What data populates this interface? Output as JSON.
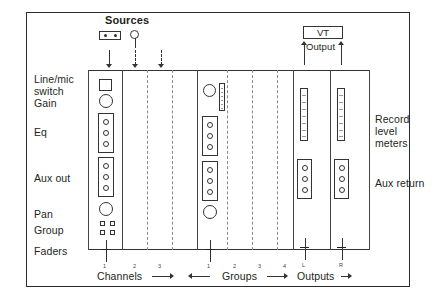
{
  "diagram": {
    "frame": {
      "border_color": "#2a2a2a",
      "background": "#ffffff"
    },
    "sources": {
      "label": "Sources",
      "icons": [
        {
          "name": "tape-machine-icon",
          "kind": "tape"
        },
        {
          "name": "microphone-icon",
          "kind": "mic"
        }
      ]
    },
    "vt": {
      "label": "VT",
      "output_label": "Output"
    },
    "row_labels": [
      {
        "id": "line-mic-switch",
        "line1": "Line/mic",
        "line2": "switch"
      },
      {
        "id": "gain",
        "text": "Gain"
      },
      {
        "id": "eq",
        "text": "Eq"
      },
      {
        "id": "aux-out",
        "text": "Aux out"
      },
      {
        "id": "pan",
        "text": "Pan"
      },
      {
        "id": "group",
        "text": "Group"
      },
      {
        "id": "faders",
        "text": "Faders"
      }
    ],
    "right_labels": [
      {
        "id": "record-level-meters",
        "line1": "Record",
        "line2": "level",
        "line3": "meters"
      },
      {
        "id": "aux-return",
        "text": "Aux return"
      }
    ],
    "sections": [
      {
        "id": "channels",
        "label": "Channels",
        "arrow": "right",
        "strip_numbers": [
          "1",
          "2",
          "3"
        ]
      },
      {
        "id": "groups",
        "label": "Groups",
        "arrow": "right",
        "lead_arrow": "left",
        "strip_numbers": [
          "1",
          "2",
          "3",
          "4"
        ]
      },
      {
        "id": "outputs",
        "label": "Outputs",
        "arrow": "right",
        "strip_numbers": [
          "L",
          "R"
        ]
      }
    ],
    "channel_strip": {
      "controls": [
        "line-mic-switch",
        "gain-knob",
        "eq-block",
        "aux-block",
        "pan-knob",
        "group-buttons",
        "fader"
      ],
      "eq_knob_count": 3,
      "aux_knob_count": 3,
      "group_button_count": 4
    },
    "group_strip": {
      "controls": [
        "gain-knob",
        "meter",
        "eq-block",
        "aux-block",
        "pan-knob",
        "fader"
      ],
      "eq_knob_count": 3,
      "aux_knob_count": 3
    },
    "output_strip": {
      "controls": [
        "record-level-meter",
        "aux-return-block",
        "fader"
      ],
      "aux_return_knob_count": 3
    }
  }
}
